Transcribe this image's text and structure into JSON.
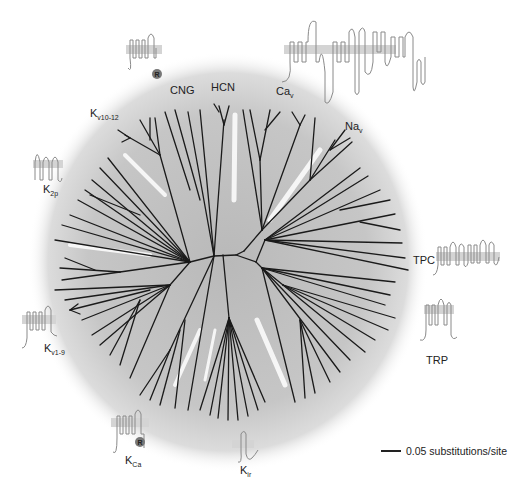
{
  "figure": {
    "type": "unrooted phylogenetic tree of voltage-gated ion channel superfamily",
    "background_color": "#ffffff",
    "tree_fill_color": "#c8c8c8",
    "branch_color": "#1a1a1a",
    "icon_color": "#888888",
    "membrane_color": "#d4d4d4"
  },
  "families": [
    {
      "id": "cng",
      "label": "CNG",
      "sub": ""
    },
    {
      "id": "hcn",
      "label": "HCN",
      "sub": ""
    },
    {
      "id": "cav",
      "label": "Ca",
      "sub": "v"
    },
    {
      "id": "nav",
      "label": "Na",
      "sub": "v"
    },
    {
      "id": "tpc",
      "label": "TPC",
      "sub": ""
    },
    {
      "id": "trp",
      "label": "TRP",
      "sub": ""
    },
    {
      "id": "kir",
      "label": "K",
      "sub": "ir"
    },
    {
      "id": "kca",
      "label": "K",
      "sub": "Ca"
    },
    {
      "id": "kv1-9",
      "label": "K",
      "sub": "v1-9"
    },
    {
      "id": "k2p",
      "label": "K",
      "sub": "2p"
    },
    {
      "id": "kv10-12",
      "label": "K",
      "sub": "v10-12"
    }
  ],
  "icons": {
    "cng_icon_domain": "R",
    "kca_icon_domain": "R"
  },
  "scale_bar": {
    "label": "0.05 substitutions/site"
  }
}
